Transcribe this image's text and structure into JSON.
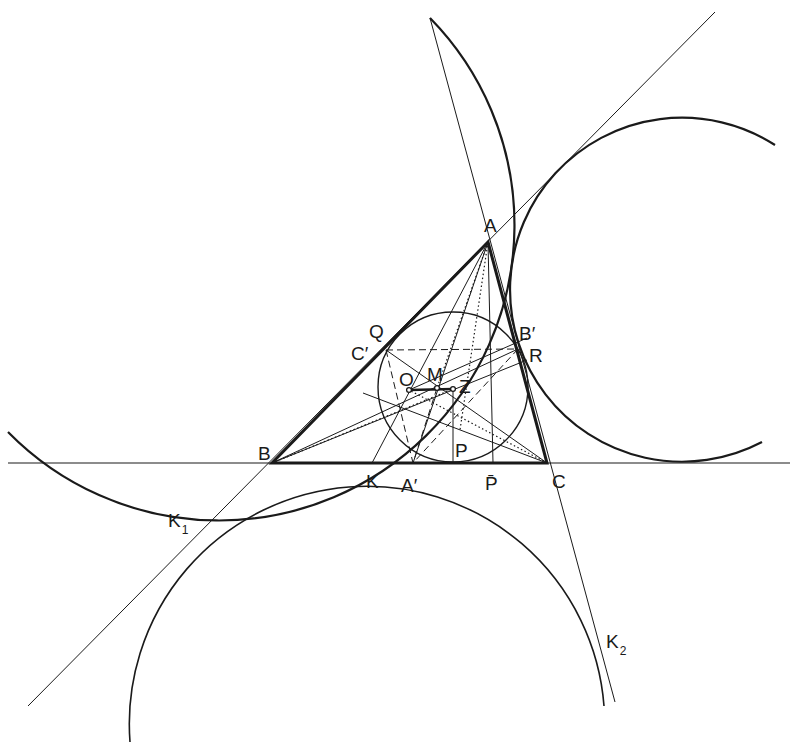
{
  "diagram": {
    "ink": "#1a1a1a",
    "background": "#ffffff",
    "triangle": {
      "A": [
        488,
        242
      ],
      "B": [
        272,
        463
      ],
      "C": [
        547,
        463
      ]
    },
    "circles": [
      {
        "name": "excircle-left",
        "cx": 168,
        "cy": 168,
        "r": 295,
        "width": 2.2,
        "arc": [
          [
            8,
            432
          ],
          [
            430,
            18
          ]
        ],
        "sweep": 0,
        "large": 0
      },
      {
        "name": "excircle-right",
        "cx": 681,
        "cy": 289,
        "r": 172,
        "width": 2.2,
        "arc": [
          [
            775,
            145
          ],
          [
            762,
            442
          ]
        ],
        "sweep": 0,
        "large": 1
      },
      {
        "name": "excircle-bottom",
        "cx": 365,
        "cy": 700,
        "r": 237,
        "width": 1.6,
        "arc": [
          [
            130,
            742
          ],
          [
            604,
            706
          ]
        ],
        "sweep": 1,
        "large": 1
      },
      {
        "name": "nine-point-circle",
        "cx": 453,
        "cy": 387,
        "r": 75,
        "width": 1.4
      }
    ],
    "long_lines": [
      {
        "name": "line-bc",
        "p1": [
          8,
          463
        ],
        "p2": [
          790,
          463
        ],
        "width": 1.2
      },
      {
        "name": "line-ab-extended",
        "p1": [
          715,
          12
        ],
        "p2": [
          28,
          706
        ],
        "width": 1.0
      },
      {
        "name": "line-ac-extended",
        "p1": [
          430,
          18
        ],
        "p2": [
          615,
          702
        ],
        "width": 1.0
      }
    ],
    "inner_lines": [
      {
        "p1": [
          272,
          463
        ],
        "p2": [
          518,
          349
        ],
        "style": "solid"
      },
      {
        "p1": [
          272,
          463
        ],
        "p2": [
          527,
          360
        ],
        "style": "solid"
      },
      {
        "p1": [
          272,
          463
        ],
        "p2": [
          453,
          389
        ],
        "style": "dotted"
      },
      {
        "p1": [
          547,
          463
        ],
        "p2": [
          386,
          350
        ],
        "style": "solid"
      },
      {
        "p1": [
          547,
          463
        ],
        "p2": [
          363,
          393
        ],
        "style": "solid"
      },
      {
        "p1": [
          547,
          463
        ],
        "p2": [
          409,
          390
        ],
        "style": "dotted"
      },
      {
        "p1": [
          488,
          242
        ],
        "p2": [
          372,
          463
        ],
        "style": "solid"
      },
      {
        "p1": [
          488,
          242
        ],
        "p2": [
          413,
          463
        ],
        "style": "solid"
      },
      {
        "p1": [
          488,
          242
        ],
        "p2": [
          437,
          388
        ],
        "style": "dotted"
      },
      {
        "p1": [
          488,
          242
        ],
        "p2": [
          493,
          463
        ],
        "style": "solid"
      },
      {
        "p1": [
          453,
          389
        ],
        "p2": [
          453,
          463
        ],
        "style": "solid"
      },
      {
        "p1": [
          409,
          390
        ],
        "p2": [
          527,
          338
        ],
        "style": "solid"
      },
      {
        "p1": [
          386,
          350
        ],
        "p2": [
          518,
          349
        ],
        "style": "dashed"
      },
      {
        "p1": [
          386,
          350
        ],
        "p2": [
          413,
          463
        ],
        "style": "dashed"
      },
      {
        "p1": [
          518,
          349
        ],
        "p2": [
          413,
          463
        ],
        "style": "dashed"
      },
      {
        "p1": [
          437,
          388
        ],
        "p2": [
          413,
          463
        ],
        "style": "dashed"
      },
      {
        "p1": [
          488,
          242
        ],
        "p2": [
          460,
          430
        ],
        "style": "dotted"
      }
    ],
    "euler_segment": {
      "p1": [
        409,
        390
      ],
      "p2": [
        453,
        389
      ]
    },
    "points": [
      {
        "name": "O",
        "x": 409,
        "y": 390
      },
      {
        "name": "M",
        "x": 437,
        "y": 388
      },
      {
        "name": "Z",
        "x": 453,
        "y": 389
      }
    ],
    "labels": [
      {
        "id": "A",
        "text": "A",
        "x": 484,
        "y": 232
      },
      {
        "id": "B",
        "text": "B",
        "x": 258,
        "y": 460
      },
      {
        "id": "C",
        "text": "C",
        "x": 552,
        "y": 488
      },
      {
        "id": "Q",
        "text": "Q",
        "x": 369,
        "y": 338
      },
      {
        "id": "C-prime",
        "text": "C′",
        "x": 351,
        "y": 360
      },
      {
        "id": "B-prime",
        "text": "B′",
        "x": 519,
        "y": 340
      },
      {
        "id": "R",
        "text": "R",
        "x": 529,
        "y": 362
      },
      {
        "id": "O",
        "text": "O",
        "x": 399,
        "y": 386
      },
      {
        "id": "M",
        "text": "M",
        "x": 427,
        "y": 381
      },
      {
        "id": "Z",
        "text": "Z",
        "x": 459,
        "y": 393
      },
      {
        "id": "P",
        "text": "P",
        "x": 455,
        "y": 457
      },
      {
        "id": "K",
        "text": "K",
        "x": 366,
        "y": 488
      },
      {
        "id": "A-prime",
        "text": "A′",
        "x": 401,
        "y": 492
      },
      {
        "id": "P-bar",
        "text": "P̄",
        "x": 485,
        "y": 490
      },
      {
        "id": "K1",
        "text": "K",
        "sub": "1",
        "x": 168,
        "y": 527
      },
      {
        "id": "K2",
        "text": "K",
        "sub": "2",
        "x": 606,
        "y": 648
      }
    ]
  }
}
